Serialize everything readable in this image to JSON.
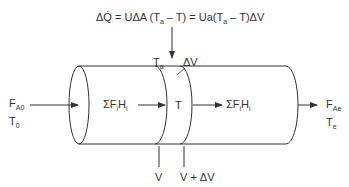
{
  "equation": {
    "lhs": "ΔQ̇",
    "rhs_part1": " = UΔA (T",
    "sub1": "a",
    "rhs_part2": " – T) = Ua(T",
    "sub2": "a",
    "rhs_part3": " – T)ΔV"
  },
  "labels": {
    "ambient_temp": {
      "main": "T",
      "sub": "a"
    },
    "delta_volume": "ΔV",
    "inlet_flow": {
      "main": "F",
      "sub": "A0"
    },
    "inlet_temp": {
      "main": "T",
      "sub": "0"
    },
    "enthalpy_in": {
      "main": "ΣF",
      "sub1": "i",
      "mid": "H",
      "sub2": "i"
    },
    "slice_temp": "T",
    "enthalpy_out": {
      "main": "ΣF",
      "sub1": "i",
      "mid": "H",
      "sub2": "i"
    },
    "outlet_flow": {
      "main": "F",
      "sub": "Ae"
    },
    "outlet_temp": {
      "main": "T",
      "sub": "e"
    },
    "volume_start": "V",
    "volume_end": "V + ΔV"
  },
  "colors": {
    "stroke": "#333333",
    "text": "#333333"
  }
}
